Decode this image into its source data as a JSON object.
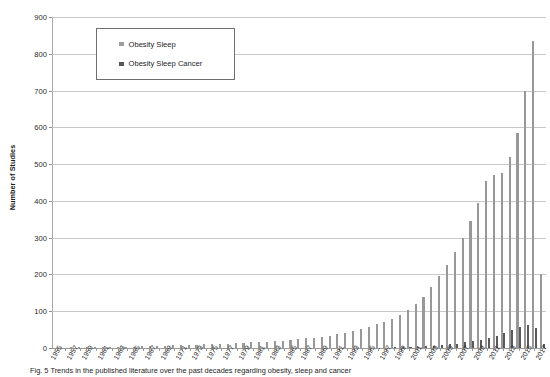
{
  "chart_data": {
    "type": "bar",
    "title": "",
    "xlabel": "",
    "ylabel": "Number of Studies",
    "ylim": [
      0,
      900
    ],
    "ytick_values": [
      0,
      100,
      200,
      300,
      400,
      500,
      600,
      700,
      800,
      900
    ],
    "ytick_labels": [
      "0",
      "100",
      "200",
      "300",
      "400",
      "500",
      "600",
      "700",
      "800",
      "900"
    ],
    "grid": true,
    "legend_position": "upper-left-inside",
    "bar_colors": {
      "obesity_sleep": "#989898",
      "obesity_sleep_cancer": "#5a5a5a"
    },
    "categories": [
      "1955",
      "1956",
      "1957",
      "1958",
      "1959",
      "1960",
      "1961",
      "1962",
      "1963",
      "1964",
      "1965",
      "1966",
      "1967",
      "1968",
      "1969",
      "1970",
      "1971",
      "1972",
      "1973",
      "1974",
      "1975",
      "1976",
      "1977",
      "1978",
      "1979",
      "1980",
      "1981",
      "1982",
      "1983",
      "1984",
      "1985",
      "1986",
      "1987",
      "1988",
      "1989",
      "1990",
      "1991",
      "1992",
      "1993",
      "1994",
      "1995",
      "1996",
      "1997",
      "1998",
      "1999",
      "2000",
      "2001",
      "2002",
      "2003",
      "2004",
      "2005",
      "2006",
      "2007",
      "2008",
      "2009",
      "2010",
      "2011",
      "2012",
      "2013",
      "2014",
      "2015",
      "2016",
      "2017"
    ],
    "xtick_labels": [
      "1955",
      "1957",
      "1959",
      "1961",
      "1963",
      "1965",
      "1967",
      "1969",
      "1971",
      "1973",
      "1975",
      "1977",
      "1979",
      "1981",
      "1983",
      "1985",
      "1987",
      "1989",
      "1991",
      "1993",
      "1995",
      "1997",
      "1999",
      "2001",
      "2003",
      "2005",
      "2007",
      "2009",
      "2011",
      "2013",
      "2015",
      "2017"
    ],
    "series": [
      {
        "name": "Obesity Sleep",
        "color": "#989898",
        "values": [
          1,
          1,
          2,
          2,
          2,
          3,
          2,
          3,
          3,
          4,
          4,
          5,
          5,
          6,
          6,
          7,
          8,
          8,
          9,
          10,
          10,
          11,
          12,
          13,
          14,
          15,
          16,
          17,
          18,
          20,
          22,
          24,
          26,
          28,
          31,
          34,
          38,
          42,
          47,
          52,
          58,
          65,
          72,
          80,
          90,
          103,
          120,
          140,
          165,
          195,
          225,
          260,
          300,
          345,
          395,
          455,
          470,
          475,
          520,
          585,
          700,
          835,
          200
        ]
      },
      {
        "name": "Obesity Sleep Cancer",
        "color": "#5a5a5a",
        "values": [
          0,
          0,
          0,
          0,
          0,
          0,
          0,
          0,
          0,
          0,
          0,
          0,
          0,
          0,
          0,
          0,
          0,
          0,
          0,
          0,
          0,
          0,
          0,
          0,
          0,
          0,
          0,
          0,
          0,
          0,
          0,
          0,
          0,
          0,
          0,
          0,
          0,
          0,
          0,
          0,
          0,
          1,
          1,
          2,
          2,
          3,
          4,
          5,
          6,
          8,
          10,
          12,
          15,
          18,
          22,
          28,
          34,
          40,
          48,
          58,
          62,
          55,
          12
        ]
      }
    ],
    "second_series_note": "2015 and 2016 light bars read 775 and 800 at the right-hand peak cluster",
    "peak_value": 835,
    "peak_category": "2016"
  },
  "legend": {
    "items": [
      {
        "label": "Obesity Sleep",
        "swatch_class": "sw-sleep"
      },
      {
        "label": "Obesity Sleep Cancer",
        "swatch_class": "sw-cancer"
      }
    ]
  },
  "caption": {
    "text": "Fig. 5 Trends in the published literature over the past decades regarding obesity, sleep and cancer"
  }
}
